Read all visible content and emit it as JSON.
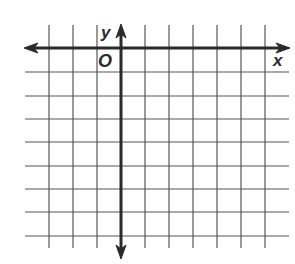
{
  "diagram": {
    "type": "coordinate-grid",
    "axis_labels": {
      "x": "x",
      "y": "y",
      "origin": "O"
    },
    "grid": {
      "columns_left_of_y_axis": 3,
      "columns_right_of_y_axis": 6,
      "rows_above_x_axis": 1,
      "rows_below_x_axis": 8
    },
    "colors": {
      "grid_line": "#555555",
      "axis": "#2a2a2a",
      "background": "#ffffff"
    }
  }
}
